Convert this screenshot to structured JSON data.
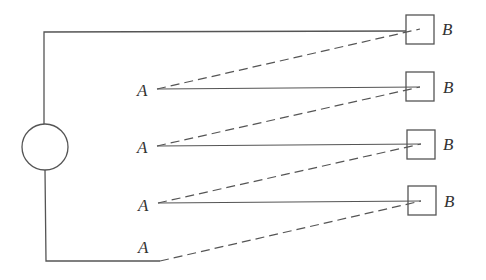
{
  "diagram": {
    "type": "circuit-schematic",
    "source": {
      "shape": "circle",
      "cx": 45,
      "cy": 147,
      "r": 23
    },
    "left_wire_x": 44,
    "top_wire_y": 32,
    "bottom_wire_y": 261,
    "bottom_wire_end_x": 160,
    "receivers": [
      {
        "label": "B",
        "box": {
          "x": 406,
          "y": 15,
          "w": 28,
          "h": 29
        },
        "tip": {
          "x": 420,
          "y": 29
        }
      },
      {
        "label": "B",
        "box": {
          "x": 406,
          "y": 72,
          "w": 28,
          "h": 29
        },
        "tip": {
          "x": 420,
          "y": 87
        }
      },
      {
        "label": "B",
        "box": {
          "x": 407,
          "y": 130,
          "w": 28,
          "h": 29
        },
        "tip": {
          "x": 421,
          "y": 144
        }
      },
      {
        "label": "B",
        "box": {
          "x": 408,
          "y": 186,
          "w": 28,
          "h": 29
        },
        "tip": {
          "x": 421,
          "y": 201
        }
      }
    ],
    "emitters": [
      {
        "label": "A",
        "point": {
          "x": 157,
          "y": 89
        }
      },
      {
        "label": "A",
        "point": {
          "x": 157,
          "y": 146
        }
      },
      {
        "label": "A",
        "point": {
          "x": 158,
          "y": 203
        }
      },
      {
        "label": "A",
        "point": {
          "x": 160,
          "y": 261
        }
      }
    ],
    "solid_connections": [
      {
        "from": "A1",
        "to": "B2"
      },
      {
        "from": "A2",
        "to": "B3"
      },
      {
        "from": "A3",
        "to": "B4"
      }
    ],
    "dashed_connections": [
      {
        "from": "A1",
        "to": "B1"
      },
      {
        "from": "A2",
        "to": "B2"
      },
      {
        "from": "A3",
        "to": "B3"
      },
      {
        "from": "A4",
        "to": "B4"
      }
    ],
    "labels": {
      "a1": "A",
      "a2": "A",
      "a3": "A",
      "a4": "A",
      "b1": "B",
      "b2": "B",
      "b3": "B",
      "b4": "B"
    },
    "colors": {
      "line": "#555555",
      "text": "#333333",
      "background": "#ffffff"
    }
  }
}
